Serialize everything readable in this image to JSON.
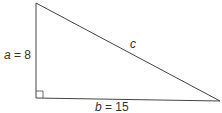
{
  "diagram": {
    "type": "right-triangle",
    "labels": {
      "a_var": "a",
      "a_val": " = 8",
      "b_var": "b",
      "b_val": " = 15",
      "c": "c"
    },
    "colors": {
      "stroke": "#444444",
      "text": "#333333"
    }
  }
}
